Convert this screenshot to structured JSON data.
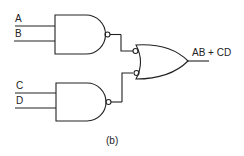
{
  "diagram": {
    "type": "logic-circuit",
    "caption": "(b)",
    "inputs": [
      {
        "label": "A",
        "gate": "nand-1"
      },
      {
        "label": "B",
        "gate": "nand-1"
      },
      {
        "label": "C",
        "gate": "nand-2"
      },
      {
        "label": "D",
        "gate": "nand-2"
      }
    ],
    "gates": [
      {
        "id": "nand-1",
        "kind": "NAND",
        "inputs": [
          "A",
          "B"
        ]
      },
      {
        "id": "nand-2",
        "kind": "NAND",
        "inputs": [
          "C",
          "D"
        ]
      },
      {
        "id": "or-neg",
        "kind": "OR with inverted inputs",
        "inputs": [
          "nand-1",
          "nand-2"
        ]
      }
    ],
    "output": {
      "label": "AB + CD"
    },
    "colors": {
      "stroke": "#222222",
      "background": "#ffffff"
    }
  }
}
